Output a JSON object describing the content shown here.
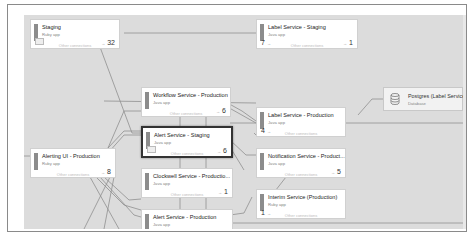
{
  "canvas": {
    "background": "#dcdcdc",
    "edge_color": "#8f8f8f"
  },
  "other_connections_label": "Other connections",
  "nodes": [
    {
      "id": "staging",
      "title": "Staging",
      "subtitle": "Ruby app",
      "in": "",
      "out": "32",
      "has_queue_icon": true,
      "selected": false
    },
    {
      "id": "label-staging",
      "title": "Label Service - Staging",
      "subtitle": "Java app",
      "in": "7",
      "out": "1",
      "has_queue_icon": false,
      "selected": false
    },
    {
      "id": "workflow-prod",
      "title": "Workflow Service - Production",
      "subtitle": "Java app",
      "in": "",
      "out": "6",
      "has_queue_icon": false,
      "selected": false
    },
    {
      "id": "label-prod",
      "title": "Label Service - Production",
      "subtitle": "Java app",
      "in": "4",
      "out": "",
      "has_queue_icon": false,
      "selected": false
    },
    {
      "id": "alerting-ui-prod",
      "title": "Alerting UI - Production",
      "subtitle": "Ruby app",
      "in": "",
      "out": "8",
      "has_queue_icon": false,
      "selected": false
    },
    {
      "id": "alert-staging",
      "title": "Alert Service - Staging",
      "subtitle": "Java app",
      "in": "",
      "out": "6",
      "has_queue_icon": true,
      "selected": true
    },
    {
      "id": "notification-prod",
      "title": "Notification Service - Product...",
      "subtitle": "Java app",
      "in": "",
      "out": "5",
      "has_queue_icon": false,
      "selected": false
    },
    {
      "id": "clockwell-prod",
      "title": "Clockwell Service - Productio...",
      "subtitle": "Java app",
      "in": "",
      "out": "1",
      "has_queue_icon": false,
      "selected": false
    },
    {
      "id": "interim-prod",
      "title": "Interim Service (Production)",
      "subtitle": "Ruby app",
      "in": "1",
      "out": "",
      "has_queue_icon": false,
      "selected": false
    },
    {
      "id": "alert-prod",
      "title": "Alert Service - Production",
      "subtitle": "Java app",
      "in": "",
      "out": "",
      "has_queue_icon": false,
      "selected": false
    }
  ],
  "database": {
    "title": "Postgres (Label Service...",
    "subtitle": "Database"
  }
}
